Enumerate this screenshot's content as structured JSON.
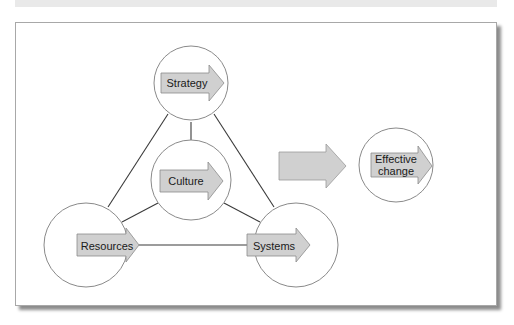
{
  "figure": {
    "caption": ""
  },
  "colors": {
    "arrow_fill": "#d0d0d0",
    "arrow_stroke": "#8c8c8c",
    "circle_stroke": "#8a8a8a",
    "connector_line": "#3a3a3a",
    "frame_border": "#a8a8a8"
  },
  "nodes": {
    "strategy": {
      "label": "Strategy"
    },
    "culture": {
      "label": "Culture"
    },
    "resources": {
      "label": "Resources"
    },
    "systems": {
      "label": "Systems"
    },
    "effective_change": {
      "label_line1": "Effective",
      "label_line2": "change"
    }
  },
  "connections": [
    {
      "from": "Strategy",
      "to": "Resources"
    },
    {
      "from": "Strategy",
      "to": "Systems"
    },
    {
      "from": "Resources",
      "to": "Systems"
    },
    {
      "from": "Culture",
      "to": "Strategy"
    },
    {
      "from": "Culture",
      "to": "Resources"
    },
    {
      "from": "Culture",
      "to": "Systems"
    },
    {
      "from": "Model",
      "to": "Effective change",
      "type": "large-arrow"
    }
  ]
}
